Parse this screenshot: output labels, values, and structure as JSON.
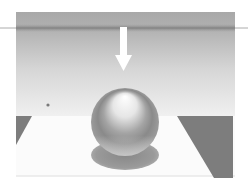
{
  "scene": {
    "description": "Shaded 3D sphere on a plane lit from above, with a downward arrow indicating light direction",
    "colors": {
      "page_background": "#ffffff",
      "backdrop_top": "#a9a9a9",
      "backdrop_band": "#8e8e8e",
      "backdrop_bottom": "#f0f0f0",
      "floor": "#fbfbfb",
      "floor_edge": "#e2e2e2",
      "dark_wedge": "#7d7d7d",
      "shadow": "#9a9a9a",
      "arrow": "#ffffff",
      "sphere_highlight": "#ffffff",
      "sphere_mid": "#b8b8b8",
      "sphere_dark": "#7a7a7a",
      "sphere_reflect": "#d8d8d8"
    },
    "elements": {
      "light_direction_arrow": "arrow-down",
      "sphere": "sphere",
      "cast_shadow": "ellipse-shadow",
      "horizon_line": "line"
    }
  }
}
